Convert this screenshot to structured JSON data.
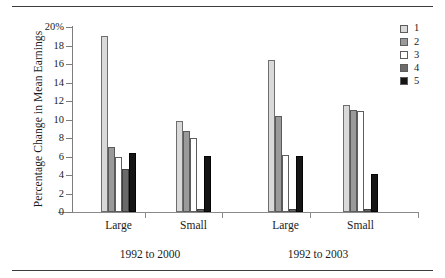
{
  "chart_data": {
    "type": "bar",
    "title": "",
    "xlabel": "",
    "ylabel": "Percentage Change in Mean Earnings",
    "ylim": [
      0,
      20
    ],
    "yticks": [
      "0",
      "2",
      "4",
      "6",
      "8",
      "10",
      "12",
      "14",
      "16",
      "18",
      "20%"
    ],
    "grid": false,
    "legend_position": "top-right",
    "categories": [
      "Large",
      "Small",
      "Large",
      "Small"
    ],
    "group_labels": [
      "1992 to 2000",
      "1992 to 2003"
    ],
    "series": [
      {
        "name": "1",
        "color": "#d9d9d9",
        "values": [
          19.0,
          9.8,
          16.4,
          11.6
        ]
      },
      {
        "name": "2",
        "color": "#9a9a9a",
        "values": [
          7.0,
          8.8,
          10.4,
          11.0
        ]
      },
      {
        "name": "3",
        "color": "#ffffff",
        "values": [
          6.0,
          8.0,
          6.2,
          10.9
        ]
      },
      {
        "name": "4",
        "color": "#6a6a6a",
        "values": [
          4.6,
          0.3,
          0.3,
          0.3
        ]
      },
      {
        "name": "5",
        "color": "#151515",
        "values": [
          6.4,
          6.1,
          6.1,
          4.1
        ]
      }
    ]
  },
  "axis": {
    "y_label": "Percentage Change in Mean Earnings",
    "y_ticks": [
      {
        "value": 20,
        "label": "20%"
      },
      {
        "value": 18,
        "label": "18"
      },
      {
        "value": 16,
        "label": "16"
      },
      {
        "value": 14,
        "label": "14"
      },
      {
        "value": 12,
        "label": "12"
      },
      {
        "value": 10,
        "label": "10"
      },
      {
        "value": 8,
        "label": "8"
      },
      {
        "value": 6,
        "label": "6"
      },
      {
        "value": 4,
        "label": "4"
      },
      {
        "value": 2,
        "label": "2"
      },
      {
        "value": 0,
        "label": "0"
      }
    ]
  },
  "groups": [
    {
      "label": "Large",
      "period": "1992 to 2000"
    },
    {
      "label": "Small",
      "period": "1992 to 2000"
    },
    {
      "label": "Large",
      "period": "1992 to 2003"
    },
    {
      "label": "Small",
      "period": "1992 to 2003"
    }
  ],
  "periods": [
    {
      "label": "1992 to 2000"
    },
    {
      "label": "1992 to 2003"
    }
  ],
  "legend": {
    "items": [
      {
        "label": "1",
        "color": "#d9d9d9"
      },
      {
        "label": "2",
        "color": "#9a9a9a"
      },
      {
        "label": "3",
        "color": "#ffffff"
      },
      {
        "label": "4",
        "color": "#6a6a6a"
      },
      {
        "label": "5",
        "color": "#151515"
      }
    ]
  }
}
